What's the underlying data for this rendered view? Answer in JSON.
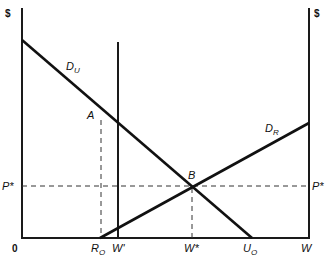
{
  "diagram": {
    "type": "economics supply-demand water allocation diagram",
    "left_axis": {
      "label": "$"
    },
    "right_axis": {
      "label": "$"
    },
    "curves": [
      {
        "id": "DU",
        "label": "D",
        "subscript": "U"
      },
      {
        "id": "DR",
        "label": "D",
        "subscript": "R"
      }
    ],
    "points": [
      {
        "id": "A",
        "label": "A"
      },
      {
        "id": "B",
        "label": "B"
      }
    ],
    "price_labels": {
      "left": "P*",
      "right": "P*"
    },
    "x_axis_labels": {
      "origin": "0",
      "RO": {
        "label": "R",
        "subscript": "O"
      },
      "Wprime": "W'",
      "Wstar": "W*",
      "UO": {
        "label": "U",
        "subscript": "O"
      },
      "W": "W"
    }
  }
}
